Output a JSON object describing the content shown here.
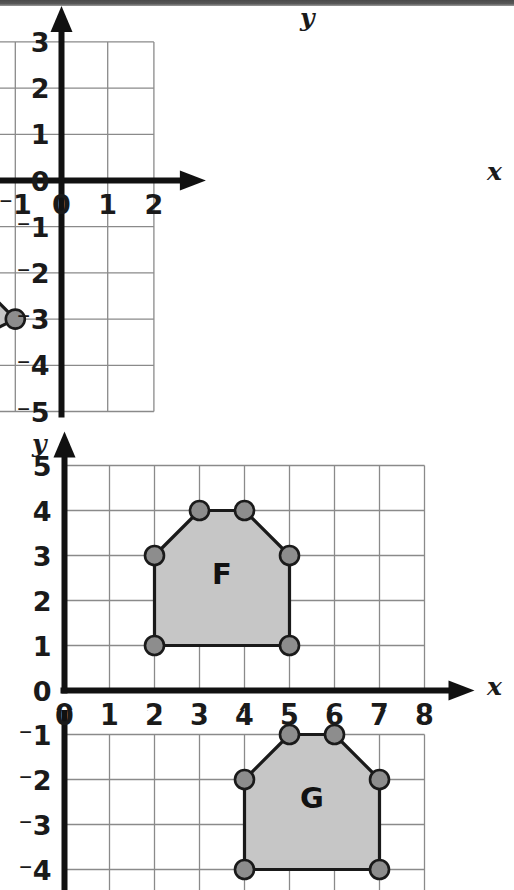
{
  "page": {
    "background_color": "#ffffff",
    "scan_band_color": "#4a4a4a",
    "width": 514,
    "height": 890
  },
  "style": {
    "grid_line_color": "#8a8a8a",
    "axis_color": "#111111",
    "shape_fill": "#c6c6c6",
    "shape_stroke": "#1a1a1a",
    "vertex_fill": "#8d8d8d",
    "vertex_stroke": "#1a1a1a",
    "label_color": "#1a1a1a"
  },
  "chart_data": [
    {
      "id": "graph-1",
      "type": "scatter",
      "title": "",
      "xlabel": "x",
      "ylabel": "y",
      "xlim": [
        -6,
        2
      ],
      "ylim": [
        -5,
        3
      ],
      "grid": true,
      "x_ticks": [
        "-6",
        "-5",
        "-4",
        "-3",
        "-2",
        "-1",
        "0",
        "1",
        "2"
      ],
      "x_tick_values": [
        -6,
        -5,
        -4,
        -3,
        -2,
        -1,
        0,
        1,
        2
      ],
      "y_ticks": [
        "3",
        "2",
        "1",
        "0",
        "-1",
        "-2",
        "-3",
        "-4",
        "-5"
      ],
      "y_tick_values": [
        3,
        2,
        1,
        0,
        -1,
        -2,
        -3,
        -4,
        -5
      ],
      "shapes": [
        {
          "label": "D",
          "label_at": [
            -2.9,
            -2.45
          ],
          "vertices": [
            [
              -3,
              -1
            ],
            [
              -5,
              -2
            ],
            [
              -3,
              -4
            ],
            [
              -1,
              -3
            ]
          ]
        }
      ]
    },
    {
      "id": "graph-2",
      "type": "scatter",
      "title": "",
      "xlabel": "x",
      "ylabel": "y",
      "xlim": [
        0,
        8
      ],
      "ylim": [
        0,
        5
      ],
      "grid": true,
      "x_ticks": [
        "0",
        "1",
        "2",
        "3",
        "4",
        "5",
        "6",
        "7",
        "8"
      ],
      "x_tick_values": [
        0,
        1,
        2,
        3,
        4,
        5,
        6,
        7,
        8
      ],
      "y_ticks": [
        "5",
        "4",
        "3",
        "2",
        "1",
        "0"
      ],
      "y_tick_values": [
        5,
        4,
        3,
        2,
        1,
        0
      ],
      "shapes": [
        {
          "label": "F",
          "label_at": [
            3.5,
            2.55
          ],
          "vertices": [
            [
              2,
              1
            ],
            [
              2,
              3
            ],
            [
              3,
              4
            ],
            [
              4,
              4
            ],
            [
              5,
              3
            ],
            [
              5,
              1
            ]
          ]
        }
      ]
    },
    {
      "id": "graph-3",
      "type": "scatter",
      "title": "",
      "xlabel": "",
      "ylabel": "",
      "xlim": [
        0,
        8
      ],
      "ylim": [
        -4.4,
        -1
      ],
      "grid": true,
      "x_ticks": [
        "0",
        "1",
        "2",
        "3",
        "4",
        "5",
        "6",
        "7",
        "8"
      ],
      "x_tick_values": [
        0,
        1,
        2,
        3,
        4,
        5,
        6,
        7,
        8
      ],
      "y_ticks": [
        "-1",
        "-2",
        "-3",
        "-4"
      ],
      "y_tick_values": [
        -1,
        -2,
        -3,
        -4
      ],
      "shapes": [
        {
          "label": "G",
          "label_at": [
            5.5,
            -2.45
          ],
          "vertices": [
            [
              4,
              -2
            ],
            [
              5,
              -1
            ],
            [
              6,
              -1
            ],
            [
              7,
              -2
            ],
            [
              7,
              -4
            ],
            [
              4,
              -4
            ]
          ]
        }
      ]
    }
  ]
}
